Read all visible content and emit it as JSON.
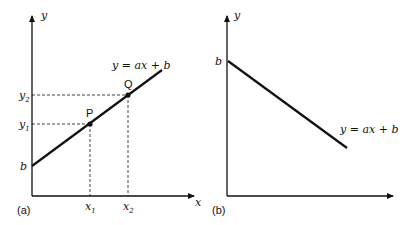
{
  "panels": [
    {
      "id": "a",
      "caption": "(a)",
      "x_axis_label": "x",
      "y_axis_label": "y",
      "equation": "y = ax + b",
      "intercept_label": "b",
      "points": [
        {
          "name": "P",
          "x_label": "x",
          "x_sub": "1",
          "y_label": "y",
          "y_sub": "1"
        },
        {
          "name": "Q",
          "x_label": "x",
          "x_sub": "2",
          "y_label": "y",
          "y_sub": "2"
        }
      ],
      "slope": "positive"
    },
    {
      "id": "b",
      "caption": "(b)",
      "y_axis_label": "y",
      "equation": "y = ax + b",
      "intercept_label": "b",
      "slope": "negative"
    }
  ]
}
